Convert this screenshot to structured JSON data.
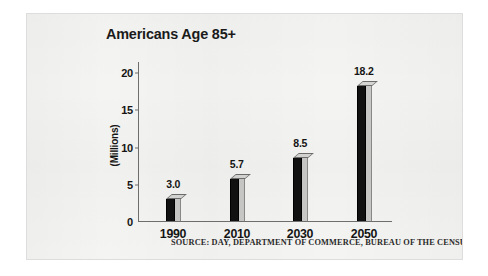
{
  "figure": {
    "background_color": "#f4f4f2",
    "border_color": "#dddddd"
  },
  "chart_data": {
    "type": "bar",
    "title": "Americans Age 85+",
    "xlabel": "",
    "ylabel": "(Millions)",
    "categories": [
      "1990",
      "2010",
      "2030",
      "2050"
    ],
    "values": [
      3.0,
      5.7,
      8.5,
      18.2
    ],
    "value_labels": [
      "3.0",
      "5.7",
      "8.5",
      "18.2"
    ],
    "ylim": [
      0,
      21.5
    ],
    "yticks": [
      0,
      5,
      10,
      15,
      20
    ],
    "ytick_labels": [
      "0",
      "5",
      "10",
      "15",
      "20"
    ],
    "grid": false,
    "legend": null,
    "bar_style": "3d-extruded",
    "bar_front_color": "#111111",
    "bar_side_color": "#c9c9c7",
    "bar_top_color": "#d6d6d4",
    "axis_color": "#6f6f6f",
    "annotations": [
      "SOURCE: DAY, DEPARTMENT OF COMMERCE, BUREAU OF THE CENSUS"
    ]
  },
  "source_note": "SOURCE: DAY, DEPARTMENT OF COMMERCE, BUREAU OF THE CENSUS"
}
